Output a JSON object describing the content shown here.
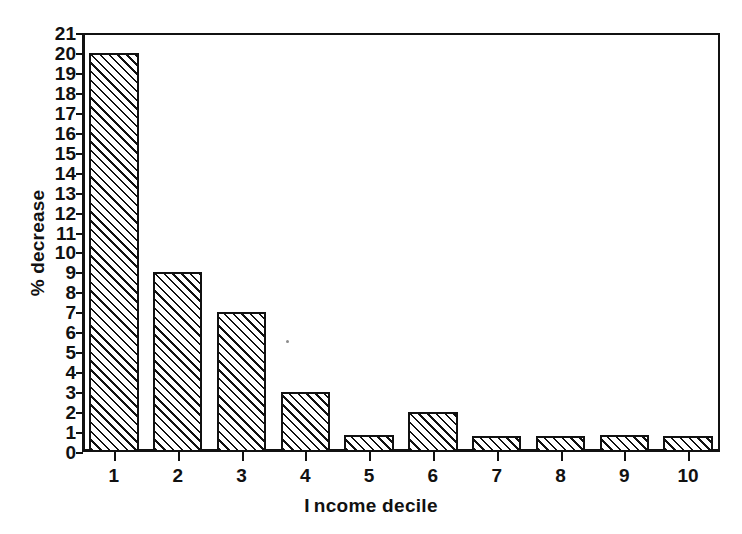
{
  "chart_data": {
    "type": "bar",
    "title": "",
    "xlabel": "Income decile",
    "ylabel": "% decrease",
    "categories": [
      "1",
      "2",
      "3",
      "4",
      "5",
      "6",
      "7",
      "8",
      "9",
      "10"
    ],
    "values": [
      20,
      9,
      7,
      3,
      0.85,
      2,
      0.8,
      0.8,
      0.85,
      0.8
    ],
    "ylim": [
      0,
      21
    ],
    "ytick_labels": [
      "0",
      "1",
      "2",
      "3",
      "4",
      "5",
      "6",
      "7",
      "8",
      "9",
      "10",
      "11",
      "12",
      "13",
      "14",
      "15",
      "16",
      "17",
      "18",
      "19",
      "20",
      "21"
    ],
    "ytick_values": [
      0,
      1,
      2,
      3,
      4,
      5,
      6,
      7,
      8,
      9,
      10,
      11,
      12,
      13,
      14,
      15,
      16,
      17,
      18,
      19,
      20,
      21
    ],
    "xtick_labels": [
      "1",
      "2",
      "3",
      "4",
      "5",
      "6",
      "7",
      "8",
      "9",
      "10"
    ],
    "grid": false,
    "legend": null,
    "bar_fill": "diagonal-hatch",
    "colors": {
      "axis": "#111111",
      "bar_outline": "#111111",
      "bar_hatch": "#111111",
      "background": "#ffffff"
    }
  }
}
